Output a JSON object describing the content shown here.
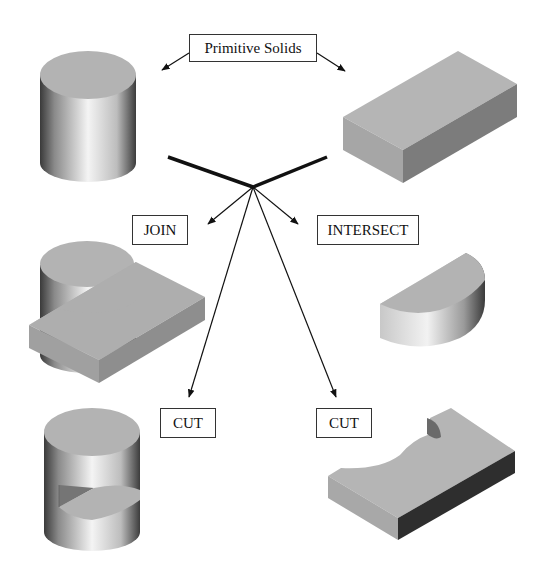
{
  "labels": {
    "primitive": "Primitive Solids",
    "join": "JOIN",
    "intersect": "INTERSECT",
    "cut_left": "CUT",
    "cut_right": "CUT"
  },
  "solids": [
    {
      "name": "cylinder",
      "role": "primitive"
    },
    {
      "name": "rectangular-block",
      "role": "primitive"
    },
    {
      "name": "join-result",
      "role": "cylinder joined with block"
    },
    {
      "name": "intersect-result",
      "role": "half-cylinder"
    },
    {
      "name": "cut-cylinder-result",
      "role": "cylinder minus block"
    },
    {
      "name": "cut-block-result",
      "role": "block minus cylinder"
    }
  ],
  "colors": {
    "top_face": "#b3b3b3",
    "side_face_light": "#a8a8a8",
    "side_face_dark": "#4a4a4a",
    "line": "#111111",
    "label_border": "#333333"
  }
}
